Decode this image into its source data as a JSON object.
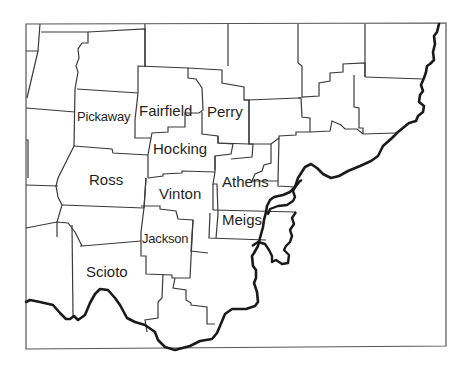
{
  "map": {
    "title": "Southeastern Ohio counties",
    "colors": {
      "background": "#ffffff",
      "county_border": "#3a3a3a",
      "river": "#1a1a1a",
      "frame": "#555555",
      "label": "#1f1f1f"
    },
    "counties": [
      {
        "name": "Pickaway",
        "label": "Pickaway"
      },
      {
        "name": "Fairfield",
        "label": "Fairfield"
      },
      {
        "name": "Perry",
        "label": "Perry"
      },
      {
        "name": "Hocking",
        "label": "Hocking"
      },
      {
        "name": "Ross",
        "label": "Ross"
      },
      {
        "name": "Vinton",
        "label": "Vinton"
      },
      {
        "name": "Athens",
        "label": "Athens"
      },
      {
        "name": "Meigs",
        "label": "Meigs"
      },
      {
        "name": "Jackson",
        "label": "Jackson"
      },
      {
        "name": "Scioto",
        "label": "Scioto"
      }
    ]
  }
}
